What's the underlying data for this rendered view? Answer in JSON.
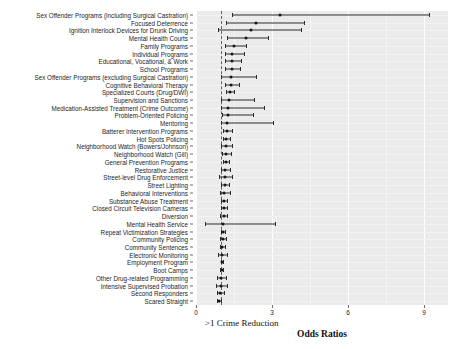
{
  "figure": {
    "axis_title": "Odds Ratios",
    "direction_note": ">1  Crime Reduction",
    "xlabel": "Odds Ratios",
    "ylabel": ""
  },
  "axis": {
    "ticks": [
      "0",
      "3",
      "6",
      "9"
    ],
    "tick_values": [
      0,
      3,
      6,
      9
    ],
    "xlim": [
      0,
      9.95
    ],
    "reference_line": 1
  },
  "chart_data": {
    "type": "scatter",
    "subtype": "forest-plot",
    "title": "",
    "xlabel": "Odds Ratios",
    "ylabel": "",
    "xlim": [
      0,
      9.95
    ],
    "grid": true,
    "legend": false,
    "reference_line": 1,
    "annotations": [
      ">1  Crime Reduction"
    ],
    "columns": [
      "program",
      "odds_ratio",
      "ci_low",
      "ci_high"
    ],
    "rows": [
      {
        "program": "Sex Offender Programs (including Surgical Castration)",
        "odds_ratio": 3.31,
        "ci_low": 1.44,
        "ci_high": 9.19
      },
      {
        "program": "Focused Deterrence",
        "odds_ratio": 2.35,
        "ci_low": 1.17,
        "ci_high": 4.26
      },
      {
        "program": "Ignition Interlock Devices for Drunk Driving",
        "odds_ratio": 2.18,
        "ci_low": 0.87,
        "ci_high": 4.15
      },
      {
        "program": "Mental Health Courts",
        "odds_ratio": 1.98,
        "ci_low": 1.24,
        "ci_high": 2.83
      },
      {
        "program": "Family Programs",
        "odds_ratio": 1.52,
        "ci_low": 1.16,
        "ci_high": 1.96
      },
      {
        "program": "Individual Programs",
        "odds_ratio": 1.44,
        "ci_low": 1.13,
        "ci_high": 1.88
      },
      {
        "program": "Educational, Vocational, & Work",
        "odds_ratio": 1.42,
        "ci_low": 1.13,
        "ci_high": 1.77
      },
      {
        "program": "School Programs",
        "odds_ratio": 1.41,
        "ci_low": 1.16,
        "ci_high": 1.74
      },
      {
        "program": "Sex Offender Programs (excluding Surgical Castration)",
        "odds_ratio": 1.4,
        "ci_low": 0.99,
        "ci_high": 2.35
      },
      {
        "program": "Cognitive Behavioral Therapy",
        "odds_ratio": 1.39,
        "ci_low": 1.16,
        "ci_high": 1.69
      },
      {
        "program": "Specialized Courts (Drug/DWI)",
        "odds_ratio": 1.33,
        "ci_low": 1.18,
        "ci_high": 1.5
      },
      {
        "program": "Supervision and Sanctions",
        "odds_ratio": 1.3,
        "ci_low": 0.99,
        "ci_high": 2.3
      },
      {
        "program": "Medication-Assisted Treatment (Crime Outcome)",
        "odds_ratio": 1.28,
        "ci_low": 0.99,
        "ci_high": 2.7
      },
      {
        "program": "Problem-Oriented Policing",
        "odds_ratio": 1.26,
        "ci_low": 1.04,
        "ci_high": 2.27
      },
      {
        "program": "Mentoring",
        "odds_ratio": 1.24,
        "ci_low": 0.99,
        "ci_high": 3.05
      },
      {
        "program": "Batterer Intervention Programs",
        "odds_ratio": 1.22,
        "ci_low": 1.06,
        "ci_high": 1.42
      },
      {
        "program": "Hot Spots Policing",
        "odds_ratio": 1.2,
        "ci_low": 1.08,
        "ci_high": 1.34
      },
      {
        "program": "Neighborhood Watch (Bowers/Johnson)",
        "odds_ratio": 1.19,
        "ci_low": 0.99,
        "ci_high": 1.43
      },
      {
        "program": "Neighborhood Watch (Gill)",
        "odds_ratio": 1.18,
        "ci_low": 1.02,
        "ci_high": 1.37
      },
      {
        "program": "General Prevention Programs",
        "odds_ratio": 1.17,
        "ci_low": 1.05,
        "ci_high": 1.3
      },
      {
        "program": "Restorative Justice",
        "odds_ratio": 1.15,
        "ci_low": 1.0,
        "ci_high": 1.33
      },
      {
        "program": "Street-level Drug Enforcement",
        "odds_ratio": 1.14,
        "ci_low": 0.92,
        "ci_high": 1.44
      },
      {
        "program": "Street Lighting",
        "odds_ratio": 1.13,
        "ci_low": 1.0,
        "ci_high": 1.29
      },
      {
        "program": "Behavioral Interventions",
        "odds_ratio": 1.12,
        "ci_low": 0.94,
        "ci_high": 1.34
      },
      {
        "program": "Substance Abuse Treatment",
        "odds_ratio": 1.11,
        "ci_low": 1.0,
        "ci_high": 1.24
      },
      {
        "program": "Closed Circuit Television Cameras",
        "odds_ratio": 1.1,
        "ci_low": 0.98,
        "ci_high": 1.24
      },
      {
        "program": "Diversion",
        "odds_ratio": 1.09,
        "ci_low": 0.96,
        "ci_high": 1.24
      },
      {
        "program": "Mental Health Service",
        "odds_ratio": 1.08,
        "ci_low": 0.37,
        "ci_high": 3.12
      },
      {
        "program": "Repeat Victimization Strategies",
        "odds_ratio": 1.07,
        "ci_low": 0.99,
        "ci_high": 1.16
      },
      {
        "program": "Community Policing",
        "odds_ratio": 1.05,
        "ci_low": 0.94,
        "ci_high": 1.17
      },
      {
        "program": "Community Sentences",
        "odds_ratio": 1.04,
        "ci_low": 0.96,
        "ci_high": 1.13
      },
      {
        "program": "Electronic Monitoring",
        "odds_ratio": 1.03,
        "ci_low": 0.85,
        "ci_high": 1.23
      },
      {
        "program": "Employment Program",
        "odds_ratio": 1.02,
        "ci_low": 0.98,
        "ci_high": 1.08
      },
      {
        "program": "Boot Camps",
        "odds_ratio": 1.01,
        "ci_low": 0.94,
        "ci_high": 1.08
      },
      {
        "program": "Other Drug-related Programming",
        "odds_ratio": 1.0,
        "ci_low": 0.84,
        "ci_high": 1.18
      },
      {
        "program": "Intensive Supervised Probation",
        "odds_ratio": 0.99,
        "ci_low": 0.79,
        "ci_high": 1.22
      },
      {
        "program": "Second Responders",
        "odds_ratio": 0.96,
        "ci_low": 0.84,
        "ci_high": 1.1
      },
      {
        "program": "Scared Straight",
        "odds_ratio": 0.92,
        "ci_low": 0.83,
        "ci_high": 1.0
      }
    ]
  }
}
